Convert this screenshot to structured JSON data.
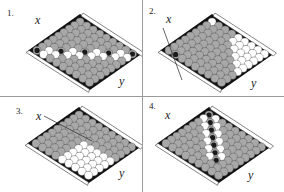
{
  "figure": {
    "panels": [
      {
        "number": "1.",
        "x_label": "x",
        "y_label": "y",
        "has_arrow": false
      },
      {
        "number": "2.",
        "x_label": "x",
        "y_label": "y",
        "has_arrow": true
      },
      {
        "number": "3.",
        "x_label": "x",
        "y_label": "y",
        "has_arrow": true
      },
      {
        "number": "4.",
        "x_label": "x",
        "y_label": "y",
        "has_arrow": false
      }
    ],
    "colors": {
      "gray_cell": "#a8a8a8",
      "white_cell": "#ffffff",
      "black_stone": "#1a1a1a",
      "border_dark": "#111111",
      "cell_outline": "#555555"
    },
    "board_size": 9
  }
}
